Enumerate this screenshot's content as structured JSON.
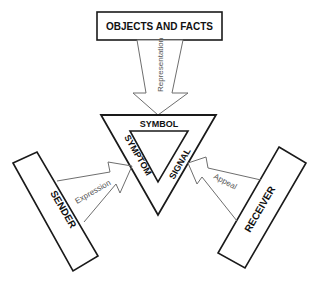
{
  "diagram": {
    "nodes": {
      "objects": {
        "label": "OBJECTS AND FACTS"
      },
      "sender": {
        "label": "SENDER"
      },
      "receiver": {
        "label": "RECEIVER"
      }
    },
    "sign": {
      "sides": {
        "top": "SYMBOL",
        "left": "SYMPTOM",
        "right": "SIGNAL"
      }
    },
    "arrows": {
      "representation": {
        "label": "Representation",
        "from": "objects",
        "to": "sign"
      },
      "expression": {
        "label": "Expression",
        "from": "sender",
        "to": "sign"
      },
      "appeal": {
        "label": "Appeal",
        "from": "receiver",
        "to": "sign"
      }
    },
    "colors": {
      "stroke": "#1a1a1a",
      "arrow_stroke": "#6e6e6e",
      "text": "#111111",
      "arrow_text": "#555555",
      "background": "#ffffff"
    }
  }
}
